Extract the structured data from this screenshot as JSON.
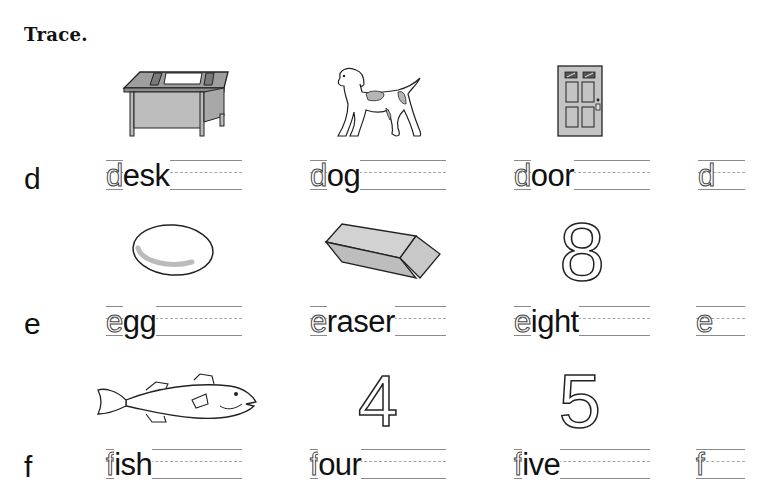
{
  "title": "Trace.",
  "rows": [
    {
      "letter": "d",
      "items": [
        {
          "picture": "desk",
          "first": "d",
          "rest": "esk"
        },
        {
          "picture": "dog",
          "first": "d",
          "rest": "og"
        },
        {
          "picture": "door",
          "first": "d",
          "rest": "oor"
        },
        {
          "picture": "",
          "first": "d",
          "rest": ""
        }
      ]
    },
    {
      "letter": "e",
      "items": [
        {
          "picture": "egg",
          "first": "e",
          "rest": "gg"
        },
        {
          "picture": "eraser",
          "first": "e",
          "rest": "raser"
        },
        {
          "picture": "numeral-8",
          "first": "e",
          "rest": "ight"
        },
        {
          "picture": "",
          "first": "e",
          "rest": ""
        }
      ]
    },
    {
      "letter": "f",
      "items": [
        {
          "picture": "fish",
          "first": "f",
          "rest": "ish"
        },
        {
          "picture": "numeral-4",
          "first": "f",
          "rest": "our"
        },
        {
          "picture": "numeral-5",
          "first": "f",
          "rest": "ive"
        },
        {
          "picture": "",
          "first": "f",
          "rest": ""
        }
      ]
    }
  ],
  "numerals": {
    "eight": "8",
    "four": "4",
    "five": "5"
  },
  "colors": {
    "ink": "#111111",
    "rule": "#8a8a8a",
    "fill_gray": "#bdbdbd"
  }
}
